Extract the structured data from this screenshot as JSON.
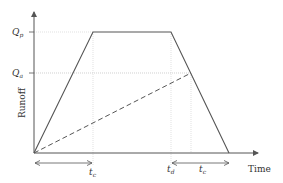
{
  "diagram": {
    "type": "rational-method-hydrograph",
    "axes": {
      "x_label": "Time",
      "y_label": "Runoff"
    },
    "y_levels": [
      {
        "id": "Qp",
        "symbol": "Q",
        "subscript": "p"
      },
      {
        "id": "Qa",
        "symbol": "Q",
        "subscript": "a"
      }
    ],
    "x_marks": [
      {
        "id": "tc_first",
        "symbol": "t",
        "subscript": "c"
      },
      {
        "id": "td",
        "symbol": "t",
        "subscript": "d"
      },
      {
        "id": "tc_second",
        "symbol": "t",
        "subscript": "c"
      }
    ],
    "curves": [
      {
        "name": "trapezoidal-hydrograph",
        "style": "solid"
      },
      {
        "name": "accumulation-line",
        "style": "dashed"
      }
    ],
    "colors": {
      "line": "#555555",
      "guide": "#bbbbbb",
      "text": "#333333"
    }
  }
}
